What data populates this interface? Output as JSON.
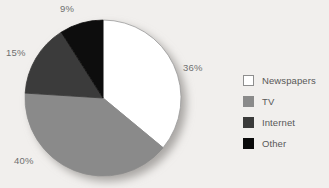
{
  "chart_data": {
    "type": "pie",
    "title": "",
    "subtitle": "",
    "xlabel": "",
    "ylabel": "",
    "grid": false,
    "legend_position": "right",
    "start_angle_deg": 0,
    "direction": "clockwise",
    "units": "percent",
    "total": 100,
    "categories": [
      "Newspapers",
      "TV",
      "Internet",
      "Other"
    ],
    "values": [
      36,
      40,
      15,
      9
    ],
    "data_labels": [
      "36%",
      "40%",
      "15%",
      "9%"
    ],
    "colors": [
      "#ffffff",
      "#8a8a8a",
      "#3a3a3a",
      "#0a0a0a"
    ],
    "slices": [
      {
        "label": "Newspapers",
        "value": 36,
        "data_label": "36%",
        "color": "#ffffff",
        "stroke": "#9a9a9a"
      },
      {
        "label": "TV",
        "value": 40,
        "data_label": "40%",
        "color": "#8a8a8a",
        "stroke": "#8a8a8a"
      },
      {
        "label": "Internet",
        "value": 15,
        "data_label": "15%",
        "color": "#3a3a3a",
        "stroke": "#3a3a3a"
      },
      {
        "label": "Other",
        "value": 9,
        "data_label": "9%",
        "color": "#0a0a0a",
        "stroke": "#0a0a0a"
      }
    ]
  },
  "pie": {
    "labels": {
      "newspapers": "36%",
      "tv": "40%",
      "internet": "15%",
      "other": "9%"
    }
  },
  "legend": {
    "items": [
      {
        "label": "Newspapers",
        "color": "#ffffff",
        "border": "#8e8e8e"
      },
      {
        "label": "TV",
        "color": "#8a8a8a",
        "border": "#8a8a8a"
      },
      {
        "label": "Internet",
        "color": "#3a3a3a",
        "border": "#3a3a3a"
      },
      {
        "label": "Other",
        "color": "#0a0a0a",
        "border": "#0a0a0a"
      }
    ]
  },
  "theme": {
    "background": "#f1efed",
    "label_color": "#6f6f6f",
    "legend_text_color": "#585858"
  }
}
